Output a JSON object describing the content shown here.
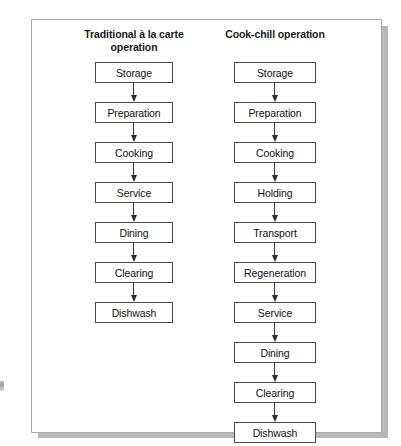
{
  "figure": {
    "columns": [
      {
        "id": "traditional",
        "title": "Traditional à la carte operation",
        "steps": [
          "Storage",
          "Preparation",
          "Cooking",
          "Service",
          "Dining",
          "Clearing",
          "Dishwash"
        ]
      },
      {
        "id": "cook-chill",
        "title": "Cook-chill operation",
        "steps": [
          "Storage",
          "Preparation",
          "Cooking",
          "Holding",
          "Transport",
          "Regeneration",
          "Service",
          "Dining",
          "Clearing",
          "Dishwash"
        ]
      }
    ],
    "colors": {
      "box_border": "#4a4a4a",
      "arrow": "#2e2e2e",
      "frame_border": "#a9a9a9",
      "text": "#111111",
      "background": "#ffffff"
    }
  }
}
